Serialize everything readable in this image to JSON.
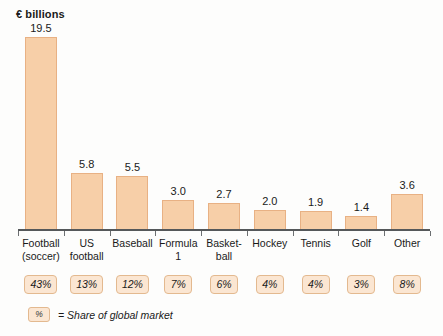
{
  "chart_data": {
    "type": "bar",
    "title": "€ billions",
    "xlabel": "",
    "ylabel": "€ billions",
    "ylim": [
      0,
      19.5
    ],
    "grid": false,
    "legend_position": "bottom-left",
    "categories": [
      "Football (soccer)",
      "US football",
      "Baseball",
      "Formula 1",
      "Basket-ball",
      "Hockey",
      "Tennis",
      "Golf",
      "Other"
    ],
    "category_lines": [
      [
        "Football",
        "(soccer)"
      ],
      [
        "US",
        "football"
      ],
      [
        "Baseball",
        ""
      ],
      [
        "Formula",
        "1"
      ],
      [
        "Basket-",
        "ball"
      ],
      [
        "Hockey",
        ""
      ],
      [
        "Tennis",
        ""
      ],
      [
        "Golf",
        ""
      ],
      [
        "Other",
        ""
      ]
    ],
    "values": [
      19.5,
      5.8,
      5.5,
      3.0,
      2.7,
      2.0,
      1.9,
      1.4,
      3.6
    ],
    "value_labels": [
      "19.5",
      "5.8",
      "5.5",
      "3.0",
      "2.7",
      "2.0",
      "1.9",
      "1.4",
      "3.6"
    ],
    "share_of_global_market": [
      "43%",
      "13%",
      "12%",
      "7%",
      "6%",
      "4%",
      "4%",
      "3%",
      "8%"
    ],
    "legend_entries": [
      {
        "symbol": "%",
        "text": "= Share of global market"
      }
    ],
    "colors": {
      "bar_fill": "#f7cfa8",
      "bar_border": "#e8b184",
      "badge_fill": "#fbe6d2",
      "badge_border": "#e3b98f",
      "axis": "#55585a",
      "text": "#1a1a1a",
      "background": "#fdfdfc"
    }
  }
}
